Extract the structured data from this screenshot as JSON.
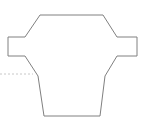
{
  "figure": {
    "canvas": {
      "width": 151,
      "height": 118,
      "background_color": "#ffffff"
    },
    "outline": {
      "name": "flanged-body-outline",
      "stroke_color": "#808080",
      "stroke_width": 1,
      "fill": "none",
      "closed": true,
      "vertices": [
        [
          40,
          15
        ],
        [
          103,
          15
        ],
        [
          117,
          37
        ],
        [
          137,
          37
        ],
        [
          137,
          56
        ],
        [
          117,
          56
        ],
        [
          105,
          76
        ],
        [
          100,
          116
        ],
        [
          44,
          116
        ],
        [
          38,
          76
        ],
        [
          25,
          56
        ],
        [
          8,
          56
        ],
        [
          8,
          37
        ],
        [
          25,
          37
        ]
      ],
      "path": "M 40 15 L 103 15 L 117 37 L 137 37 L 137 56 L 117 56 L 105 76 L 100 116 L 44 116 L 38 76 L 25 56 L 8 56 L 8 37 L 25 37 Z"
    },
    "guide": {
      "name": "horizontal-dotted-guide",
      "stroke_color": "#c8c8c8",
      "stroke_width": 1,
      "dash_pattern": "2 2",
      "start": [
        0,
        74
      ],
      "end": [
        33,
        74
      ],
      "path": "M 0 74 L 33 74"
    }
  }
}
